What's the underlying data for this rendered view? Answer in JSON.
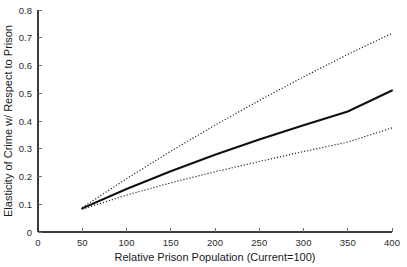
{
  "chart_data": {
    "type": "line",
    "title": "",
    "xlabel": "Relative Prison Population (Current=100)",
    "ylabel": "Elasticity of Crime w/ Respect to Prison",
    "xlim": [
      0,
      400
    ],
    "ylim": [
      0,
      0.8
    ],
    "xticks": [
      0,
      50,
      100,
      150,
      200,
      250,
      300,
      350,
      400
    ],
    "xtick_labels": [
      "0",
      "50",
      "100",
      "150",
      "200",
      "250",
      "300",
      "350",
      "400"
    ],
    "yticks": [
      0,
      0.1,
      0.2,
      0.3,
      0.4,
      0.5,
      0.6,
      0.7,
      0.8
    ],
    "ytick_labels": [
      "0",
      "0.1",
      "0.2",
      "0.3",
      "0.4",
      "0.5",
      "0.6",
      "0.7",
      "0.8"
    ],
    "grid": false,
    "legend": false,
    "x": [
      50,
      100,
      150,
      200,
      250,
      300,
      350,
      400
    ],
    "series": [
      {
        "name": "Upper confidence bound",
        "style": "dotted",
        "color": "#1c1c1c",
        "values": [
          0.088,
          0.192,
          0.291,
          0.385,
          0.474,
          0.559,
          0.64,
          0.716
        ]
      },
      {
        "name": "Point estimate",
        "style": "solid",
        "color": "#101010",
        "values": [
          0.085,
          0.155,
          0.219,
          0.278,
          0.333,
          0.385,
          0.434,
          0.51
        ]
      },
      {
        "name": "Lower confidence bound",
        "style": "dotted",
        "color": "#1c1c1c",
        "values": [
          0.082,
          0.133,
          0.177,
          0.217,
          0.254,
          0.29,
          0.324,
          0.375
        ]
      }
    ]
  },
  "figure": {
    "background_color": "#ffffff",
    "axis_color": "#3a3a3a"
  }
}
